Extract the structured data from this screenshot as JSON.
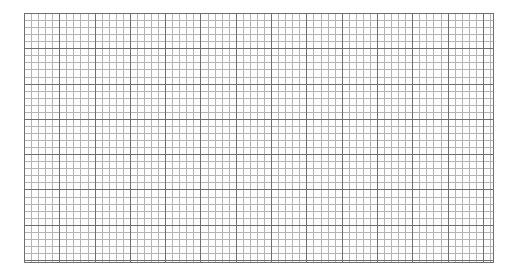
{
  "document": {
    "type": "graph-paper",
    "title": "",
    "background_color": "#ffffff"
  },
  "chart_data": {
    "type": "table",
    "title": "",
    "subtitle": "",
    "xlabel": "",
    "ylabel": "",
    "grid": true,
    "legend": false,
    "legend_position": "none",
    "series": [],
    "categories": [],
    "values": [],
    "annotations": [],
    "tick_labels": {
      "x": [],
      "y": []
    }
  },
  "grid": {
    "origin_x_px": 24,
    "origin_y_px": 13,
    "width_px": 470,
    "height_px": 250,
    "minor_cell_px": 7.06,
    "major_cell_px": 35.3,
    "minor_per_major": 5,
    "minor_columns": 66,
    "minor_rows": 35,
    "major_columns": 13,
    "major_rows": 7,
    "minor_line_color": "#b4b4b4",
    "major_line_color": "#6e6e6e",
    "border_color": "#6e6e6e",
    "paper_color": "#fefefe"
  }
}
